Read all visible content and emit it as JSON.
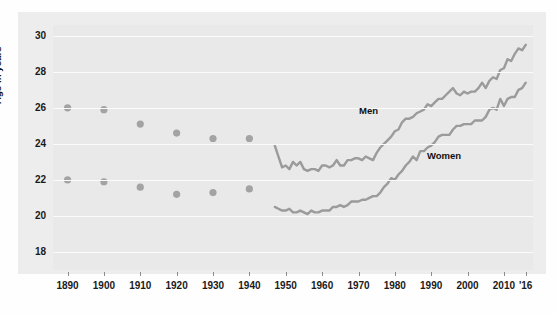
{
  "chart_data": {
    "type": "line",
    "title": "",
    "subtitle": "",
    "xlabel": "",
    "ylabel": "Age in years",
    "xlim": [
      1886,
      2018
    ],
    "ylim": [
      17,
      30.6
    ],
    "yticks": [
      18,
      20,
      22,
      24,
      26,
      28,
      30
    ],
    "xticks": [
      1890,
      1900,
      1910,
      1920,
      1930,
      1940,
      1950,
      1960,
      1970,
      1980,
      1990,
      2000,
      2010,
      2016
    ],
    "xtick_labels": [
      "1890",
      "1900",
      "1910",
      "1920",
      "1930",
      "1940",
      "1950",
      "1960",
      "1970",
      "1980",
      "1990",
      "2000",
      "2010",
      "'16"
    ],
    "grid": "horizontal-white",
    "legend_position": "inline-annotations",
    "line_color": "#9b9b9b",
    "marker_color": "#a3a3a3",
    "plot_bg": "#e9e9e9",
    "gridline_color": "#fbfbfb",
    "series": [
      {
        "name": "Men",
        "label": "Men",
        "marker_points": {
          "x": [
            1890,
            1900,
            1910,
            1920,
            1930,
            1940
          ],
          "y": [
            26.0,
            25.9,
            25.1,
            24.6,
            24.3,
            24.3
          ]
        },
        "line_points": {
          "x": [
            1947,
            1948,
            1949,
            1950,
            1951,
            1952,
            1953,
            1954,
            1955,
            1956,
            1957,
            1958,
            1959,
            1960,
            1961,
            1962,
            1963,
            1964,
            1965,
            1966,
            1967,
            1968,
            1969,
            1970,
            1971,
            1972,
            1973,
            1974,
            1975,
            1976,
            1977,
            1978,
            1979,
            1980,
            1981,
            1982,
            1983,
            1984,
            1985,
            1986,
            1987,
            1988,
            1989,
            1990,
            1991,
            1992,
            1993,
            1994,
            1995,
            1996,
            1997,
            1998,
            1999,
            2000,
            2001,
            2002,
            2003,
            2004,
            2005,
            2006,
            2007,
            2008,
            2009,
            2010,
            2011,
            2012,
            2013,
            2014,
            2015,
            2016
          ],
          "y": [
            23.9,
            23.3,
            22.7,
            22.8,
            22.6,
            23.0,
            22.8,
            23.0,
            22.6,
            22.5,
            22.6,
            22.6,
            22.5,
            22.8,
            22.8,
            22.7,
            22.8,
            23.1,
            22.8,
            22.8,
            23.1,
            23.1,
            23.2,
            23.2,
            23.1,
            23.3,
            23.2,
            23.1,
            23.5,
            23.8,
            24.0,
            24.2,
            24.4,
            24.7,
            24.8,
            25.2,
            25.4,
            25.4,
            25.5,
            25.7,
            25.8,
            25.9,
            26.2,
            26.1,
            26.3,
            26.5,
            26.5,
            26.7,
            26.9,
            27.1,
            26.8,
            26.7,
            26.9,
            26.8,
            26.9,
            26.9,
            27.1,
            27.4,
            27.1,
            27.5,
            27.7,
            27.6,
            28.1,
            28.2,
            28.7,
            28.6,
            29.0,
            29.3,
            29.2,
            29.5
          ]
        }
      },
      {
        "name": "Women",
        "label": "Women",
        "marker_points": {
          "x": [
            1890,
            1900,
            1910,
            1920,
            1930,
            1940
          ],
          "y": [
            22.0,
            21.9,
            21.6,
            21.2,
            21.3,
            21.5
          ]
        },
        "line_points": {
          "x": [
            1947,
            1948,
            1949,
            1950,
            1951,
            1952,
            1953,
            1954,
            1955,
            1956,
            1957,
            1958,
            1959,
            1960,
            1961,
            1962,
            1963,
            1964,
            1965,
            1966,
            1967,
            1968,
            1969,
            1970,
            1971,
            1972,
            1973,
            1974,
            1975,
            1976,
            1977,
            1978,
            1979,
            1980,
            1981,
            1982,
            1983,
            1984,
            1985,
            1986,
            1987,
            1988,
            1989,
            1990,
            1991,
            1992,
            1993,
            1994,
            1995,
            1996,
            1997,
            1998,
            1999,
            2000,
            2001,
            2002,
            2003,
            2004,
            2005,
            2006,
            2007,
            2008,
            2009,
            2010,
            2011,
            2012,
            2013,
            2014,
            2015,
            2016
          ],
          "y": [
            20.5,
            20.4,
            20.3,
            20.3,
            20.4,
            20.2,
            20.2,
            20.3,
            20.2,
            20.1,
            20.3,
            20.2,
            20.2,
            20.3,
            20.3,
            20.3,
            20.5,
            20.5,
            20.6,
            20.5,
            20.6,
            20.8,
            20.8,
            20.8,
            20.9,
            20.9,
            21.0,
            21.1,
            21.1,
            21.3,
            21.6,
            21.8,
            22.1,
            22.0,
            22.3,
            22.5,
            22.8,
            23.0,
            23.3,
            23.1,
            23.6,
            23.6,
            23.8,
            23.9,
            24.1,
            24.4,
            24.5,
            24.5,
            24.5,
            24.8,
            25.0,
            25.0,
            25.1,
            25.1,
            25.1,
            25.3,
            25.3,
            25.3,
            25.5,
            25.9,
            26.0,
            25.9,
            26.5,
            26.1,
            26.5,
            26.6,
            26.6,
            27.0,
            27.1,
            27.4
          ]
        }
      }
    ]
  }
}
